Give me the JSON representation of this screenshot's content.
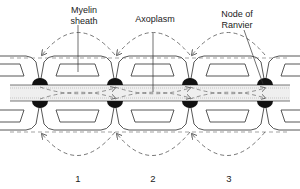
{
  "labels": {
    "myelin_line1": "Myelin",
    "myelin_line2": "sheath",
    "axoplasm": "Axoplasm",
    "node_line1": "Node of",
    "node_line2": "Ranvier"
  },
  "segments": [
    "1",
    "2",
    "3"
  ],
  "colors": {
    "line": "#444444",
    "node": "#111111",
    "dash": "#555555",
    "axoplasm_fill": "#e6e6e6"
  }
}
